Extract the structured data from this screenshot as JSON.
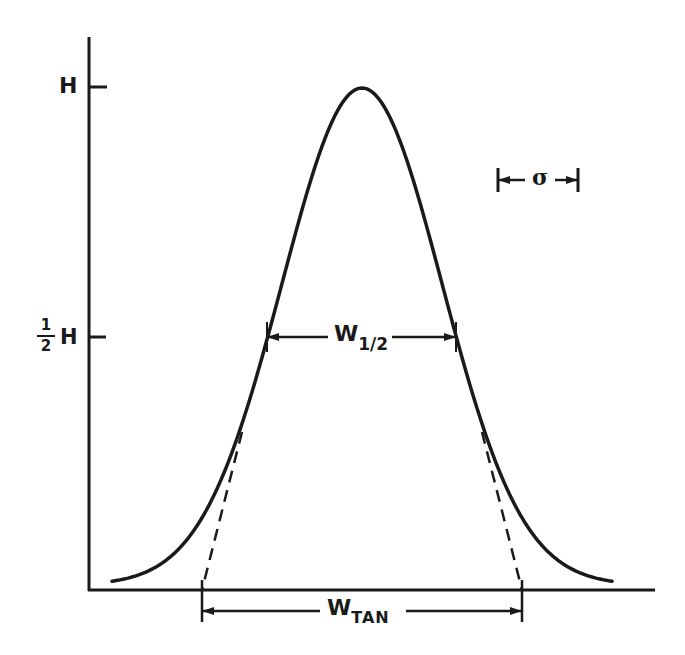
{
  "figure": {
    "colors": {
      "ink": "#1a1a1a",
      "background": "#ffffff"
    }
  },
  "labels": {
    "height": "H",
    "half_height_num": "1",
    "half_height_den": "2",
    "half_height_symbol": "H",
    "sigma": "σ",
    "w_half_main": "W",
    "w_half_sub": "1/2",
    "w_tan_main": "W",
    "w_tan_sub": "TAN"
  },
  "geometry": {
    "axis_origin": [
      89,
      590
    ],
    "axis_top_y": 37,
    "axis_right_x": 655,
    "peak_center_x": 362,
    "peak_y": 88,
    "sigma_px": 80,
    "curve_x_range": [
      112,
      612
    ],
    "tick_h_y": 87,
    "tick_half_y": 337,
    "sigma_bar": {
      "x1": 498,
      "x2": 578,
      "y": 180
    },
    "w_half_arrow": {
      "x1": 267,
      "x2": 456,
      "y": 337
    },
    "w_tan_arrow": {
      "x1": 202,
      "x2": 522,
      "y": 611
    }
  }
}
